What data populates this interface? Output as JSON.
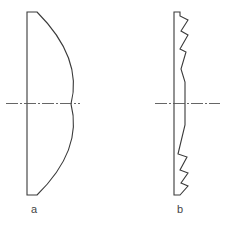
{
  "diagram": {
    "colors": {
      "stroke": "#3a3a3a",
      "axis": "#555555",
      "label": "#444444",
      "background": "#ffffff"
    },
    "figures": [
      {
        "id": "a",
        "label": "a",
        "type": "plano-convex-lens"
      },
      {
        "id": "b",
        "label": "b",
        "type": "fresnel-lens"
      }
    ]
  }
}
